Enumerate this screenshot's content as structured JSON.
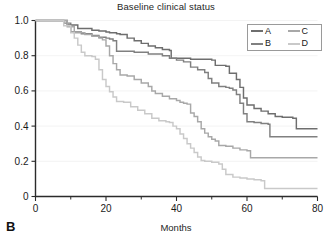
{
  "panel": {
    "label": "B"
  },
  "chart_data": {
    "type": "line",
    "title": "Baseline clinical status",
    "xlabel": "Months",
    "ylabel": "",
    "xlim": [
      0,
      80
    ],
    "ylim": [
      0,
      1.0
    ],
    "grid": false,
    "legend_position": "top-right",
    "x_ticks": [
      0,
      20,
      40,
      60,
      80
    ],
    "x_tick_labels": [
      "0",
      "20",
      "40",
      "60",
      "80"
    ],
    "x_minor_ticks": [
      10,
      30,
      50,
      70
    ],
    "y_ticks": [
      0,
      0.2,
      0.4,
      0.6,
      0.8,
      1.0
    ],
    "y_tick_labels": [
      "0",
      "0.2",
      "0.4",
      "0.6",
      "0.8",
      "1.0"
    ],
    "series": [
      {
        "name": "A",
        "color": "#6e6e6e",
        "points": [
          [
            0,
            1.0
          ],
          [
            6,
            1.0
          ],
          [
            9,
            0.975
          ],
          [
            12,
            0.955
          ],
          [
            16,
            0.945
          ],
          [
            18,
            0.94
          ],
          [
            20,
            0.935
          ],
          [
            21,
            0.93
          ],
          [
            23,
            0.925
          ],
          [
            24,
            0.92
          ],
          [
            26,
            0.9
          ],
          [
            28,
            0.885
          ],
          [
            30,
            0.87
          ],
          [
            32,
            0.855
          ],
          [
            34,
            0.845
          ],
          [
            36,
            0.835
          ],
          [
            38,
            0.83
          ],
          [
            38.5,
            0.785
          ],
          [
            44,
            0.78
          ],
          [
            48,
            0.78
          ],
          [
            50,
            0.775
          ],
          [
            51,
            0.745
          ],
          [
            54,
            0.74
          ],
          [
            55,
            0.7
          ],
          [
            57,
            0.665
          ],
          [
            58,
            0.62
          ],
          [
            59,
            0.56
          ],
          [
            60,
            0.52
          ],
          [
            62,
            0.5
          ],
          [
            64,
            0.485
          ],
          [
            66,
            0.47
          ],
          [
            68,
            0.455
          ],
          [
            70,
            0.45
          ],
          [
            73,
            0.445
          ],
          [
            74,
            0.385
          ],
          [
            80,
            0.385
          ]
        ]
      },
      {
        "name": "B",
        "color": "#808080",
        "points": [
          [
            0,
            1.0
          ],
          [
            6,
            1.0
          ],
          [
            8,
            0.985
          ],
          [
            10,
            0.935
          ],
          [
            13,
            0.925
          ],
          [
            16,
            0.915
          ],
          [
            18,
            0.905
          ],
          [
            20,
            0.9
          ],
          [
            21,
            0.895
          ],
          [
            22,
            0.885
          ],
          [
            23,
            0.825
          ],
          [
            28,
            0.82
          ],
          [
            32,
            0.81
          ],
          [
            36,
            0.8
          ],
          [
            38,
            0.785
          ],
          [
            40,
            0.775
          ],
          [
            42,
            0.765
          ],
          [
            44,
            0.735
          ],
          [
            46,
            0.72
          ],
          [
            48,
            0.705
          ],
          [
            49,
            0.67
          ],
          [
            50,
            0.645
          ],
          [
            52,
            0.625
          ],
          [
            54,
            0.62
          ],
          [
            55,
            0.615
          ],
          [
            56,
            0.605
          ],
          [
            57,
            0.58
          ],
          [
            58,
            0.53
          ],
          [
            59,
            0.47
          ],
          [
            60,
            0.425
          ],
          [
            62,
            0.42
          ],
          [
            64,
            0.415
          ],
          [
            66,
            0.41
          ],
          [
            66.5,
            0.34
          ],
          [
            80,
            0.34
          ]
        ]
      },
      {
        "name": "C",
        "color": "#a8a8a8",
        "points": [
          [
            0,
            1.0
          ],
          [
            6,
            1.0
          ],
          [
            9,
            0.965
          ],
          [
            11,
            0.93
          ],
          [
            14,
            0.92
          ],
          [
            16,
            0.91
          ],
          [
            18,
            0.9
          ],
          [
            19,
            0.89
          ],
          [
            20,
            0.855
          ],
          [
            21,
            0.8
          ],
          [
            22,
            0.755
          ],
          [
            23,
            0.72
          ],
          [
            24,
            0.69
          ],
          [
            26,
            0.685
          ],
          [
            28,
            0.665
          ],
          [
            30,
            0.645
          ],
          [
            32,
            0.625
          ],
          [
            33,
            0.6
          ],
          [
            34,
            0.585
          ],
          [
            36,
            0.57
          ],
          [
            38,
            0.555
          ],
          [
            40,
            0.545
          ],
          [
            41,
            0.535
          ],
          [
            42,
            0.53
          ],
          [
            43,
            0.525
          ],
          [
            44,
            0.475
          ],
          [
            45,
            0.455
          ],
          [
            46,
            0.425
          ],
          [
            47,
            0.385
          ],
          [
            48,
            0.36
          ],
          [
            49,
            0.34
          ],
          [
            50,
            0.325
          ],
          [
            51,
            0.315
          ],
          [
            52,
            0.29
          ],
          [
            54,
            0.285
          ],
          [
            56,
            0.275
          ],
          [
            58,
            0.265
          ],
          [
            60,
            0.26
          ],
          [
            61,
            0.22
          ],
          [
            80,
            0.22
          ]
        ]
      },
      {
        "name": "D",
        "color": "#c9c9c9",
        "points": [
          [
            0,
            1.0
          ],
          [
            6,
            1.0
          ],
          [
            8,
            0.97
          ],
          [
            10,
            0.93
          ],
          [
            11,
            0.9
          ],
          [
            12,
            0.86
          ],
          [
            13,
            0.82
          ],
          [
            14,
            0.8
          ],
          [
            16,
            0.795
          ],
          [
            17,
            0.78
          ],
          [
            18,
            0.72
          ],
          [
            19,
            0.665
          ],
          [
            20,
            0.625
          ],
          [
            21,
            0.595
          ],
          [
            22,
            0.565
          ],
          [
            23,
            0.54
          ],
          [
            25,
            0.535
          ],
          [
            27,
            0.51
          ],
          [
            29,
            0.49
          ],
          [
            31,
            0.47
          ],
          [
            33,
            0.445
          ],
          [
            35,
            0.43
          ],
          [
            37,
            0.425
          ],
          [
            38,
            0.42
          ],
          [
            39,
            0.4
          ],
          [
            40,
            0.385
          ],
          [
            41,
            0.355
          ],
          [
            42,
            0.33
          ],
          [
            43,
            0.3
          ],
          [
            44,
            0.275
          ],
          [
            45,
            0.25
          ],
          [
            46,
            0.225
          ],
          [
            47,
            0.205
          ],
          [
            48,
            0.2
          ],
          [
            50,
            0.195
          ],
          [
            52,
            0.185
          ],
          [
            53,
            0.155
          ],
          [
            54,
            0.125
          ],
          [
            56,
            0.11
          ],
          [
            58,
            0.105
          ],
          [
            60,
            0.1
          ],
          [
            62,
            0.095
          ],
          [
            64,
            0.09
          ],
          [
            65,
            0.045
          ],
          [
            80,
            0.045
          ]
        ]
      }
    ],
    "legend": [
      {
        "label": "A",
        "color": "#6e6e6e"
      },
      {
        "label": "C",
        "color": "#a8a8a8"
      },
      {
        "label": "B",
        "color": "#808080"
      },
      {
        "label": "D",
        "color": "#c9c9c9"
      }
    ]
  }
}
